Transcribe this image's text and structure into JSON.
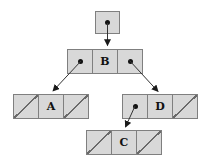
{
  "diagram": {
    "type": "binary-tree-linked-representation",
    "colors": {
      "cell_fill": "#d8d8d8",
      "cell_border": "#7f7f7f",
      "arrow": "#333333",
      "text": "#111111",
      "background": "#ffffff"
    },
    "root_pointer": {
      "points_to": "B"
    },
    "nodes": {
      "B": {
        "label": "B",
        "left_child": "A",
        "right_child": "D"
      },
      "A": {
        "label": "A",
        "left_child": null,
        "right_child": null
      },
      "D": {
        "label": "D",
        "left_child": "C",
        "right_child": null
      },
      "C": {
        "label": "C",
        "left_child": null,
        "right_child": null
      }
    },
    "edges": [
      {
        "from": "root-pointer",
        "to": "B"
      },
      {
        "from": "B.left",
        "to": "A"
      },
      {
        "from": "B.right",
        "to": "D"
      },
      {
        "from": "D.left",
        "to": "C"
      }
    ],
    "null_pointers": [
      "A.left",
      "A.right",
      "D.right",
      "C.left",
      "C.right"
    ]
  }
}
